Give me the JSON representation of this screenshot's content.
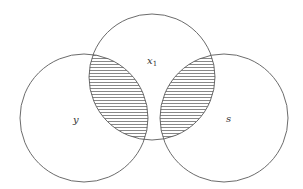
{
  "diagram": {
    "type": "venn",
    "sets": [
      {
        "id": "x1",
        "label": "x",
        "subscript": "1",
        "cx": 152,
        "cy": 77,
        "r": 63,
        "label_pos": [
          147,
          64
        ]
      },
      {
        "id": "y",
        "label": "y",
        "subscript": "",
        "cx": 84,
        "cy": 118,
        "r": 64,
        "label_pos": [
          73,
          123
        ]
      },
      {
        "id": "s",
        "label": "s",
        "subscript": "",
        "cx": 224,
        "cy": 118,
        "r": 64,
        "label_pos": [
          226,
          122
        ]
      }
    ],
    "shaded_regions": [
      {
        "name": "x1 ∩ y",
        "sets": [
          "x1",
          "y"
        ]
      },
      {
        "name": "x1 ∩ s",
        "sets": [
          "x1",
          "s"
        ]
      }
    ],
    "hatch": {
      "direction": "horizontal",
      "spacing": 3,
      "color": "#7a7a7a"
    },
    "stroke_color": "#5a5a5a",
    "background": "#ffffff"
  }
}
